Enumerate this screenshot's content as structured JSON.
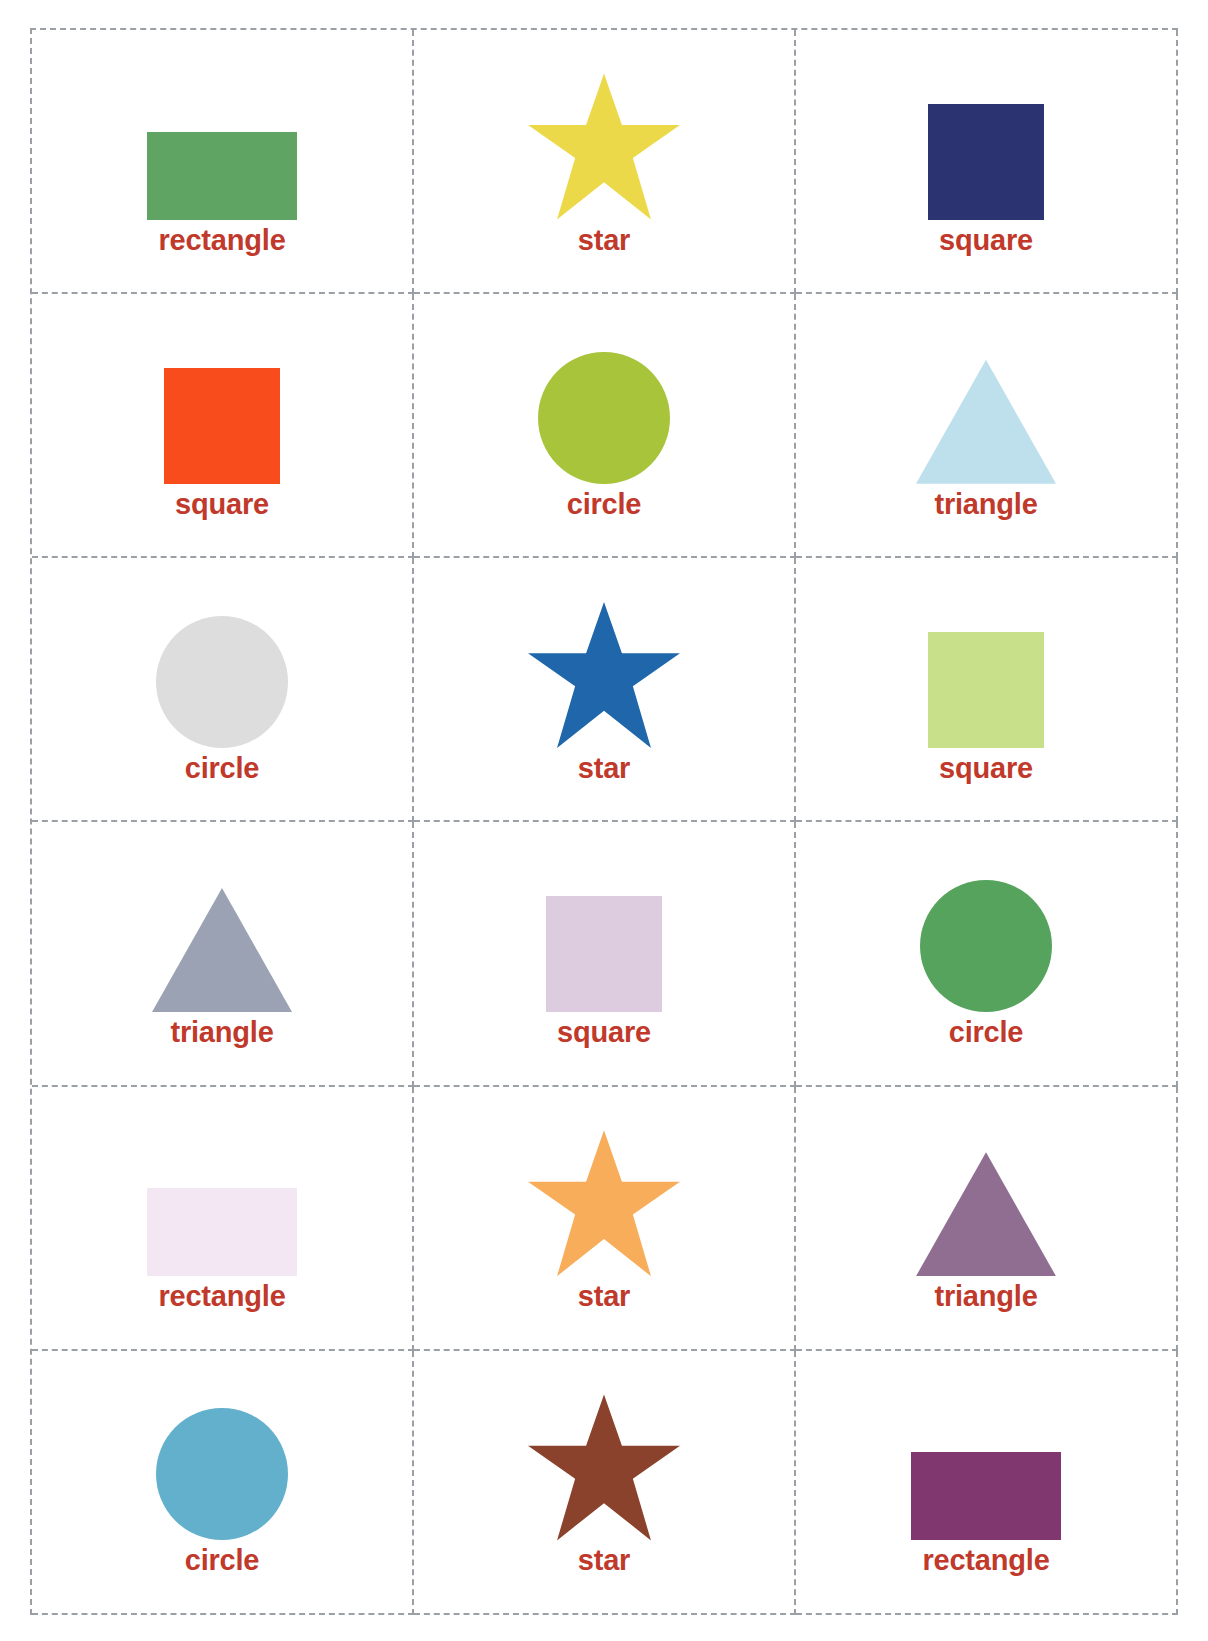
{
  "sheet": {
    "title": "shapes flashcards worksheet",
    "label_color": "#c0392b",
    "cut_line_color": "#9aa0a6",
    "background": "#ffffff",
    "columns": 3,
    "rows": 6
  },
  "cards": [
    {
      "label": "rectangle",
      "shape": "rectangle",
      "color": "#5fa463",
      "icon": "rectangle-icon"
    },
    {
      "label": "star",
      "shape": "star",
      "color": "#ecd94a",
      "icon": "star-icon"
    },
    {
      "label": "square",
      "shape": "square",
      "color": "#2b3470",
      "icon": "square-icon"
    },
    {
      "label": "square",
      "shape": "square",
      "color": "#f94c1c",
      "icon": "square-icon"
    },
    {
      "label": "circle",
      "shape": "circle",
      "color": "#a8c43a",
      "icon": "circle-icon"
    },
    {
      "label": "triangle",
      "shape": "triangle",
      "color": "#bee0ec",
      "icon": "triangle-icon"
    },
    {
      "label": "circle",
      "shape": "circle",
      "color": "#dddddd",
      "icon": "circle-icon"
    },
    {
      "label": "star",
      "shape": "star",
      "color": "#1f66ab",
      "icon": "star-icon"
    },
    {
      "label": "square",
      "shape": "square",
      "color": "#c9e08a",
      "icon": "square-icon"
    },
    {
      "label": "triangle",
      "shape": "triangle",
      "color": "#9ba2b4",
      "icon": "triangle-icon"
    },
    {
      "label": "square",
      "shape": "square",
      "color": "#ddcce0",
      "icon": "square-icon"
    },
    {
      "label": "circle",
      "shape": "circle",
      "color": "#55a35c",
      "icon": "circle-icon"
    },
    {
      "label": "rectangle",
      "shape": "rectangle",
      "color": "#f2e7f2",
      "icon": "rectangle-icon"
    },
    {
      "label": "star",
      "shape": "star",
      "color": "#f8ad5a",
      "icon": "star-icon"
    },
    {
      "label": "triangle",
      "shape": "triangle",
      "color": "#8f6e92",
      "icon": "triangle-icon"
    },
    {
      "label": "circle",
      "shape": "circle",
      "color": "#62b0cc",
      "icon": "circle-icon"
    },
    {
      "label": "star",
      "shape": "star",
      "color": "#8a422c",
      "icon": "star-icon"
    },
    {
      "label": "rectangle",
      "shape": "rectangle",
      "color": "#80366f",
      "icon": "rectangle-icon"
    }
  ]
}
